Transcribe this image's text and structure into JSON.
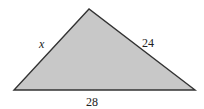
{
  "diagram": {
    "type": "triangle",
    "fill_color": "#c8c8c8",
    "stroke_color": "#333333",
    "vertices": {
      "top": [
        89,
        9
      ],
      "bottom_left": [
        14,
        90
      ],
      "bottom_right": [
        195,
        90
      ]
    },
    "labels": {
      "left_side": "x",
      "right_side": "24",
      "base": "28"
    }
  }
}
